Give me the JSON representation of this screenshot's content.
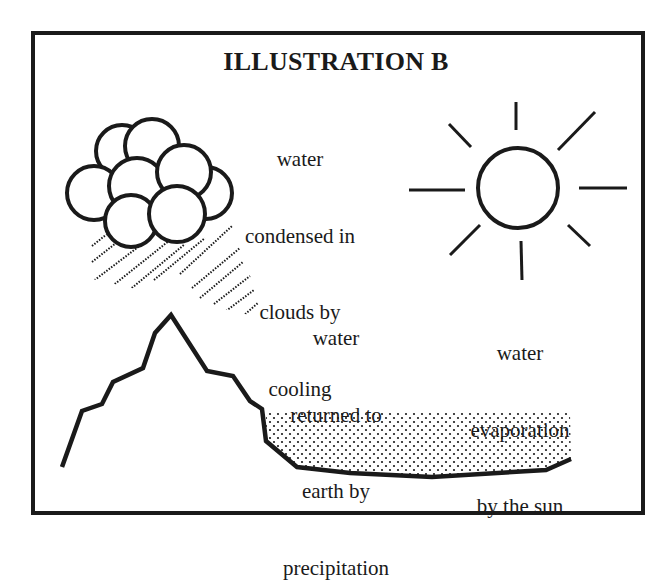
{
  "title": "ILLUSTRATION B",
  "labels": {
    "condensation": [
      "water",
      "condensed in",
      "clouds by",
      "cooling"
    ],
    "precipitation": [
      "water",
      "returned to",
      "earth by",
      "precipitation"
    ],
    "evaporation": [
      "water",
      "evaporation",
      "by the sun"
    ]
  },
  "elements": {
    "cloud": "cloud-icon",
    "rain": "rain-hatching",
    "sun": "sun-icon",
    "mountain": "mountain-outline",
    "water_body": "stippled-water"
  },
  "colors": {
    "ink": "#1a1a1a",
    "background": "#ffffff"
  }
}
